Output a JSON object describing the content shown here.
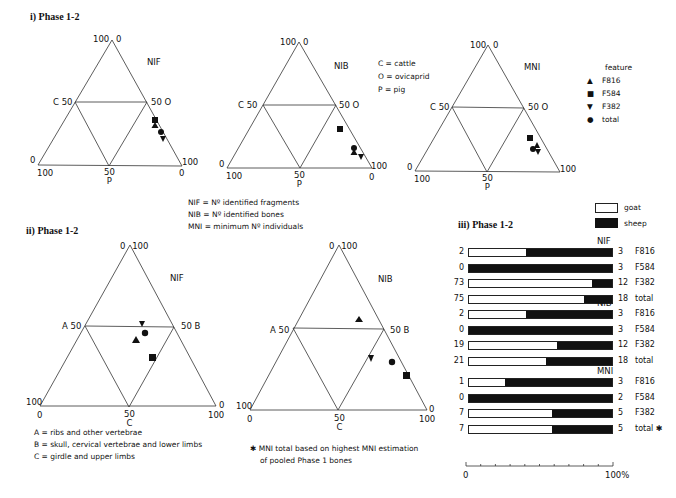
{
  "section_i": {
    "title": "i) Phase 1-2"
  },
  "section_ii": {
    "title": "ii) Phase 1-2"
  },
  "section_iii": {
    "title": "iii) Phase 1-2"
  },
  "legend_species": {
    "c": "C = cattle",
    "o": "O = ovicaprid",
    "p": "P = pig"
  },
  "legend_feature": {
    "title": "feature",
    "items": [
      {
        "symbol": "triangle-up",
        "label": "F816"
      },
      {
        "symbol": "square",
        "label": "F584"
      },
      {
        "symbol": "triangle-down",
        "label": "F382"
      },
      {
        "symbol": "circle",
        "label": "total"
      }
    ]
  },
  "definitions": {
    "nif": "NIF = Nº identified fragments",
    "nib": "NIB = Nº identified bones",
    "mni": "MNI = minimum Nº individuals"
  },
  "body_parts": {
    "a": "A = ribs and other vertebrae",
    "b": "B = skull, cervical vertebrae and lower limbs",
    "c": "C = girdle and upper limbs"
  },
  "footnote": {
    "line1": "✱ MNI total based on highest MNI estimation",
    "line2": "of pooled Phase 1 bones"
  },
  "bar_legend": {
    "goat": "goat",
    "sheep": "sheep"
  },
  "chart_data": [
    {
      "type": "ternary",
      "title": "NIF",
      "section": "i",
      "axes": {
        "left": "C",
        "right": "O",
        "bottom": "P"
      },
      "tick_labels": {
        "apex": [
          "100",
          "0"
        ],
        "left_mid": "C 50",
        "right_mid": "50 O",
        "bottom_left": [
          "0",
          "100"
        ],
        "bottom_mid": [
          "50",
          "P"
        ],
        "bottom_right": [
          "100",
          "0"
        ]
      },
      "points": [
        {
          "feature": "F584",
          "symbol": "square",
          "C": 30,
          "O": 60,
          "P": 10
        },
        {
          "feature": "F816",
          "symbol": "triangle-up",
          "C": 27,
          "O": 62,
          "P": 11
        },
        {
          "feature": "total",
          "symbol": "circle",
          "C": 20,
          "O": 68,
          "P": 12
        },
        {
          "feature": "F382",
          "symbol": "triangle-down",
          "C": 16,
          "O": 72,
          "P": 12
        }
      ]
    },
    {
      "type": "ternary",
      "title": "NIB",
      "section": "i",
      "axes": {
        "left": "C",
        "right": "O",
        "bottom": "P"
      },
      "tick_labels": {
        "apex": [
          "100",
          "0"
        ],
        "left_mid": "C 50",
        "right_mid": "50 O",
        "bottom_left": [
          "0",
          "100"
        ],
        "bottom_mid": [
          "50",
          "P"
        ],
        "bottom_right": [
          "100",
          "0"
        ]
      },
      "points": [
        {
          "feature": "F584",
          "symbol": "square",
          "C": 32,
          "O": 55,
          "P": 13
        },
        {
          "feature": "total",
          "symbol": "circle",
          "C": 15,
          "O": 65,
          "P": 20
        },
        {
          "feature": "F816",
          "symbol": "triangle-up",
          "C": 12,
          "O": 68,
          "P": 20
        },
        {
          "feature": "F382",
          "symbol": "triangle-down",
          "C": 8,
          "O": 80,
          "P": 12
        }
      ]
    },
    {
      "type": "ternary",
      "title": "MNI",
      "section": "i",
      "axes": {
        "left": "C",
        "right": "O",
        "bottom": "P"
      },
      "tick_labels": {
        "apex": [
          "100",
          "0"
        ],
        "left_mid": "C 50",
        "right_mid": "50 O",
        "bottom_left": [
          "0",
          "100"
        ],
        "bottom_mid": [
          "50",
          "P"
        ],
        "bottom_right": [
          "100",
          "0"
        ]
      },
      "points": [
        {
          "feature": "F584",
          "symbol": "square",
          "C": 30,
          "O": 50,
          "P": 20
        },
        {
          "feature": "total",
          "symbol": "circle",
          "C": 20,
          "O": 52,
          "P": 28
        },
        {
          "feature": "F816",
          "symbol": "triangle-up",
          "C": 22,
          "O": 56,
          "P": 22
        },
        {
          "feature": "F382",
          "symbol": "triangle-down",
          "C": 18,
          "O": 58,
          "P": 24
        }
      ]
    },
    {
      "type": "ternary",
      "title": "NIF",
      "section": "ii",
      "axes": {
        "left": "A",
        "right": "B",
        "bottom": "C"
      },
      "tick_labels": {
        "apex": [
          "0",
          "100"
        ],
        "left_mid": "A 50",
        "right_mid": "50 B",
        "bottom_left": [
          "100",
          "0"
        ],
        "bottom_mid": [
          "50",
          "C"
        ],
        "bottom_right": [
          "0",
          "100"
        ]
      },
      "points": [
        {
          "feature": "F382",
          "symbol": "triangle-down",
          "A": 26,
          "B": 24,
          "C": 50
        },
        {
          "feature": "total",
          "symbol": "circle",
          "A": 24,
          "B": 30,
          "C": 46
        },
        {
          "feature": "F816",
          "symbol": "triangle-up",
          "A": 30,
          "B": 30,
          "C": 40
        },
        {
          "feature": "F584",
          "symbol": "square",
          "A": 20,
          "B": 45,
          "C": 35
        }
      ]
    },
    {
      "type": "ternary",
      "title": "NIB",
      "section": "ii",
      "axes": {
        "left": "A",
        "right": "B",
        "bottom": "C"
      },
      "tick_labels": {
        "apex": [
          "0",
          "100"
        ],
        "left_mid": "A 50",
        "right_mid": "50 B",
        "bottom_left": [
          "100",
          "0"
        ],
        "bottom_mid": [
          "50",
          "C"
        ],
        "bottom_right": [
          "0",
          "100"
        ]
      },
      "points": [
        {
          "feature": "F816",
          "symbol": "triangle-up",
          "A": 20,
          "B": 25,
          "C": 55
        },
        {
          "feature": "F382",
          "symbol": "triangle-down",
          "A": 14,
          "B": 52,
          "C": 34
        },
        {
          "feature": "total",
          "symbol": "circle",
          "A": 4,
          "B": 58,
          "C": 38
        },
        {
          "feature": "F584",
          "symbol": "square",
          "A": 2,
          "B": 68,
          "C": 30
        }
      ]
    },
    {
      "type": "stacked-bar-100",
      "title": "iii) Phase 1-2",
      "series": [
        {
          "name": "goat",
          "color": "#ffffff"
        },
        {
          "name": "sheep",
          "color": "#111111"
        }
      ],
      "xaxis": {
        "min": 0,
        "max": 100,
        "labels": [
          "0",
          "100%"
        ],
        "ticks": 11
      },
      "groups": [
        {
          "name": "NIF",
          "rows": [
            {
              "feature": "F816",
              "goat": 2,
              "sheep": 3
            },
            {
              "feature": "F584",
              "goat": 0,
              "sheep": 3
            },
            {
              "feature": "F382",
              "goat": 73,
              "sheep": 12
            },
            {
              "feature": "total",
              "goat": 75,
              "sheep": 18
            }
          ]
        },
        {
          "name": "NIB",
          "rows": [
            {
              "feature": "F816",
              "goat": 2,
              "sheep": 3
            },
            {
              "feature": "F584",
              "goat": 0,
              "sheep": 3
            },
            {
              "feature": "F382",
              "goat": 19,
              "sheep": 12
            },
            {
              "feature": "total",
              "goat": 21,
              "sheep": 18
            }
          ]
        },
        {
          "name": "MNI",
          "rows": [
            {
              "feature": "F816",
              "goat": 1,
              "sheep": 3
            },
            {
              "feature": "F584",
              "goat": 0,
              "sheep": 2
            },
            {
              "feature": "F382",
              "goat": 7,
              "sheep": 5
            },
            {
              "feature": "total ✱",
              "goat": 7,
              "sheep": 5
            }
          ]
        }
      ]
    }
  ]
}
